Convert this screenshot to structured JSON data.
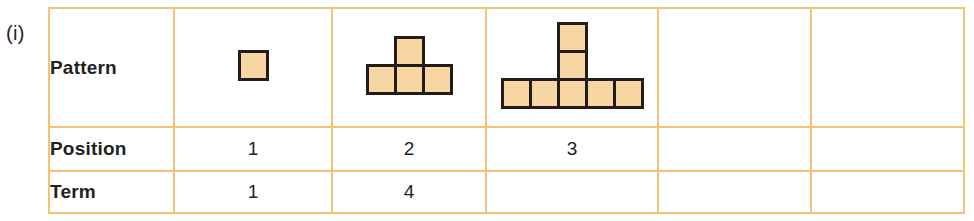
{
  "part_label": "(i)",
  "colors": {
    "grid_line": "#f0c475",
    "header_bg": "#fbf0dc",
    "square_fill": "#f8d7a4",
    "square_border": "#231c18",
    "text": "#231f20",
    "page_bg": "#ffffff"
  },
  "table": {
    "row_headers": {
      "pattern": "Pattern",
      "position": "Position",
      "term": "Term"
    },
    "columns": 5,
    "patterns": [
      {
        "label": "pattern-position-1",
        "squares_total": 1,
        "bottom_row": 1,
        "stack_height": 0
      },
      {
        "label": "pattern-position-2",
        "squares_total": 4,
        "bottom_row": 3,
        "stack_height": 1
      },
      {
        "label": "pattern-position-3",
        "squares_total": 7,
        "bottom_row": 5,
        "stack_height": 2
      },
      {
        "label": "pattern-position-4",
        "squares_total": null,
        "bottom_row": 0,
        "stack_height": 0
      },
      {
        "label": "pattern-position-5",
        "squares_total": null,
        "bottom_row": 0,
        "stack_height": 0
      }
    ],
    "position_values": [
      "1",
      "2",
      "3",
      "",
      ""
    ],
    "term_values": [
      "1",
      "4",
      "",
      "",
      ""
    ]
  },
  "chart_data": {
    "type": "table",
    "title": "",
    "row_labels": [
      "Pattern",
      "Position",
      "Term"
    ],
    "categories": [
      "1",
      "2",
      "3",
      "",
      ""
    ],
    "series": [
      {
        "name": "Position",
        "values": [
          "1",
          "2",
          "3",
          "",
          ""
        ]
      },
      {
        "name": "Term",
        "values": [
          "1",
          "4",
          "",
          "",
          ""
        ]
      },
      {
        "name": "Pattern squares",
        "values": [
          1,
          4,
          7,
          null,
          null
        ]
      }
    ]
  }
}
